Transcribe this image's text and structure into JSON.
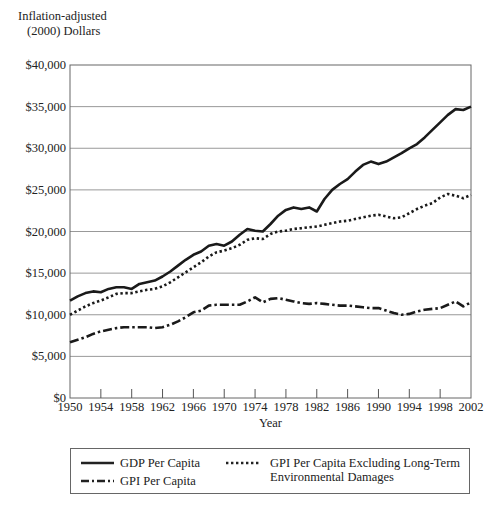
{
  "chart_data": {
    "type": "line",
    "title": "",
    "ylabel": "Inflation-adjusted (2000) Dollars",
    "ylabel_lines": [
      "Inflation-adjusted",
      "(2000) Dollars"
    ],
    "xlabel": "Year",
    "xlim": [
      1950,
      2002
    ],
    "ylim": [
      0,
      40000
    ],
    "grid": "horizontal",
    "legend_position": "bottom",
    "x_ticks": [
      1950,
      1954,
      1958,
      1962,
      1966,
      1970,
      1974,
      1978,
      1982,
      1986,
      1990,
      1994,
      1998,
      2002
    ],
    "y_ticks": [
      0,
      5000,
      10000,
      15000,
      20000,
      25000,
      30000,
      35000,
      40000
    ],
    "y_tick_labels": [
      "$0",
      "$5,000",
      "$10,000",
      "$15,000",
      "$20,000",
      "$25,000",
      "$30,000",
      "$35,000",
      "$40,000"
    ],
    "x": [
      1950,
      1951,
      1952,
      1953,
      1954,
      1955,
      1956,
      1957,
      1958,
      1959,
      1960,
      1961,
      1962,
      1963,
      1964,
      1965,
      1966,
      1967,
      1968,
      1969,
      1970,
      1971,
      1972,
      1973,
      1974,
      1975,
      1976,
      1977,
      1978,
      1979,
      1980,
      1981,
      1982,
      1983,
      1984,
      1985,
      1986,
      1987,
      1988,
      1989,
      1990,
      1991,
      1992,
      1993,
      1994,
      1995,
      1996,
      1997,
      1998,
      1999,
      2000,
      2001,
      2002
    ],
    "series": [
      {
        "name": "GDP Per Capita",
        "style": "solid",
        "values": [
          11700,
          12200,
          12600,
          12800,
          12700,
          13100,
          13300,
          13300,
          13100,
          13700,
          13900,
          14100,
          14600,
          15200,
          15900,
          16600,
          17200,
          17600,
          18300,
          18500,
          18300,
          18800,
          19600,
          20300,
          20100,
          20000,
          20900,
          21900,
          22600,
          22900,
          22700,
          22900,
          22400,
          23900,
          25000,
          25700,
          26300,
          27200,
          28000,
          28400,
          28100,
          28400,
          28900,
          29400,
          30000,
          30500,
          31300,
          32200,
          33100,
          34000,
          34700,
          34600,
          35000
        ]
      },
      {
        "name": "GPI Per Capita Excluding Long-Term Environmental Damages",
        "style": "dotted",
        "values": [
          10000,
          10500,
          11000,
          11400,
          11700,
          12100,
          12500,
          12600,
          12600,
          12800,
          13000,
          13100,
          13400,
          13900,
          14500,
          15100,
          15700,
          16300,
          17000,
          17500,
          17700,
          18000,
          18400,
          19000,
          19200,
          19100,
          19700,
          20000,
          20100,
          20300,
          20400,
          20500,
          20600,
          20800,
          21000,
          21200,
          21300,
          21500,
          21700,
          21900,
          22000,
          21800,
          21600,
          21700,
          22200,
          22700,
          23100,
          23400,
          24100,
          24500,
          24300,
          24000,
          24400
        ]
      },
      {
        "name": "GPI Per Capita",
        "style": "dash-dot",
        "values": [
          6700,
          7000,
          7300,
          7700,
          8000,
          8200,
          8400,
          8500,
          8500,
          8500,
          8500,
          8400,
          8500,
          8800,
          9200,
          9700,
          10300,
          10500,
          11100,
          11200,
          11200,
          11200,
          11200,
          11600,
          12100,
          11500,
          11900,
          12000,
          11800,
          11600,
          11400,
          11300,
          11400,
          11300,
          11200,
          11100,
          11100,
          11000,
          10900,
          10800,
          10800,
          10500,
          10200,
          10000,
          10100,
          10400,
          10600,
          10700,
          10800,
          11200,
          11600,
          11000,
          11500
        ]
      }
    ]
  },
  "legend": {
    "items": [
      {
        "label": "GDP Per Capita",
        "style": "solid"
      },
      {
        "label": "GPI Per Capita",
        "style": "dash-dot"
      },
      {
        "label_line1": "GPI Per Capita Excluding Long-Term",
        "label_line2": "Environmental Damages",
        "style": "dotted"
      }
    ]
  }
}
